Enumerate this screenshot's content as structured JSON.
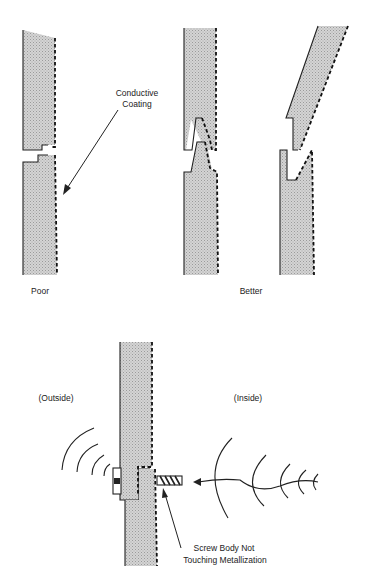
{
  "figure": {
    "top": {
      "labels": {
        "coating": [
          "Conductive",
          "Coating"
        ],
        "poor": "Poor",
        "better": "Better"
      }
    },
    "bottom": {
      "labels": {
        "outside": "(Outside)",
        "inside": "(Inside)",
        "screw_note": [
          "Screw Body Not",
          "Touching Metallization"
        ]
      }
    },
    "colors": {
      "panel_fill": "#c9c9c9",
      "ink": "#222222",
      "background": "#ffffff"
    }
  }
}
